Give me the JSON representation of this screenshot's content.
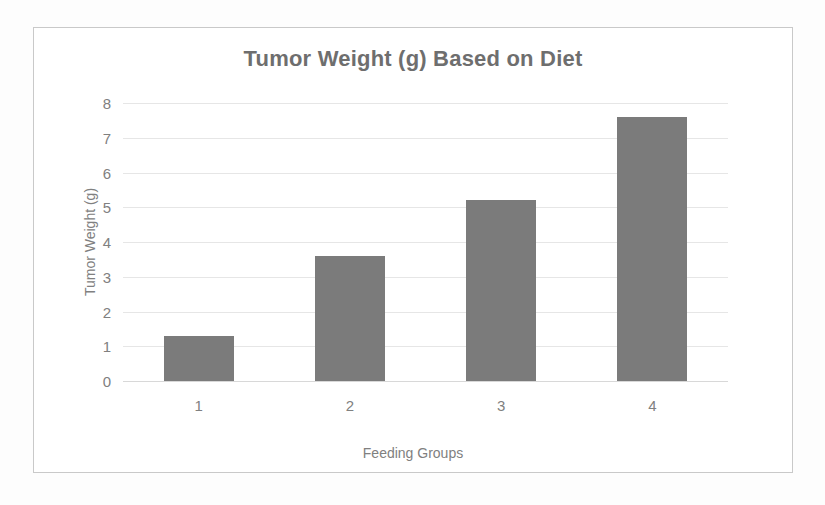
{
  "chart_data": {
    "type": "bar",
    "title": "Tumor Weight (g) Based on Diet",
    "categories": [
      "1",
      "2",
      "3",
      "4"
    ],
    "values": [
      1.3,
      3.6,
      5.2,
      7.6
    ],
    "xlabel": "Feeding Groups",
    "ylabel": "Tumor Weight (g)",
    "ylim": [
      0,
      8
    ],
    "ytick_labels": [
      "8",
      "7",
      "6",
      "5",
      "4",
      "3",
      "2",
      "1",
      "0"
    ],
    "ytick_values": [
      8,
      7,
      6,
      5,
      4,
      3,
      2,
      1,
      0
    ],
    "grid": true,
    "legend": false,
    "series_color": "#7b7b7b",
    "title_color": "#6e6e6e",
    "text_color": "#808080",
    "gridline_color": "#e6e6e6",
    "frame_color": "#c9c9c9"
  }
}
